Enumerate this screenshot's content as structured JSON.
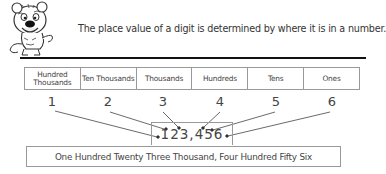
{
  "header": {
    "mascot_icon": "cartoon-tiger-mascot",
    "intro_text": "The place value of a digit is determined by where it is in a number."
  },
  "place_value_table": {
    "columns": [
      {
        "label": "Hundred Thousands",
        "digit_position": "1"
      },
      {
        "label": "Ten Thousands",
        "digit_position": "2"
      },
      {
        "label": "Thousands",
        "digit_position": "3"
      },
      {
        "label": "Hundreds",
        "digit_position": "4"
      },
      {
        "label": "Tens",
        "digit_position": "5"
      },
      {
        "label": "Ones",
        "digit_position": "6"
      }
    ]
  },
  "digit_labels": [
    "1",
    "2",
    "3",
    "4",
    "5",
    "6"
  ],
  "example_number": "123,456",
  "number_in_words": "One Hundred Twenty Three Thousand, Four Hundred Fifty Six"
}
